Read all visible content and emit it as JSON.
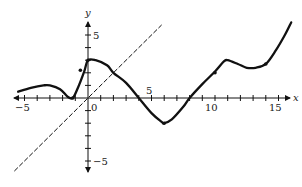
{
  "chart_data": {
    "type": "line",
    "title": "",
    "xlabel": "x",
    "ylabel": "y",
    "xlim": [
      -5.5,
      16
    ],
    "ylim": [
      -6,
      6
    ],
    "grid": false,
    "legend": null,
    "x_ticks": [
      -5,
      -4,
      -3,
      -2,
      -1,
      0,
      1,
      2,
      3,
      4,
      5,
      6,
      7,
      8,
      9,
      10,
      11,
      12,
      13,
      14,
      15
    ],
    "y_ticks": [
      -5,
      -4,
      -3,
      -2,
      -1,
      1,
      2,
      3,
      4,
      5
    ],
    "x_tick_labels": [
      "-5",
      "0",
      "5",
      "10",
      "15"
    ],
    "y_tick_labels": [
      "5",
      "-5"
    ],
    "origin_label": "0",
    "series": [
      {
        "name": "f(x)",
        "style": "solid",
        "color": "#111111",
        "x": [
          -5.5,
          -4.5,
          -3.5,
          -3,
          -2.2,
          -1.6,
          -1.2,
          -0.8,
          -0.3,
          0,
          0.6,
          1.5,
          2,
          3,
          4,
          5,
          5.8,
          6,
          6.6,
          7.5,
          8,
          9,
          10,
          10.7,
          11,
          11.8,
          12.5,
          13.2,
          14,
          14.8,
          15.5,
          16
        ],
        "y": [
          0.5,
          0.8,
          1.0,
          1.0,
          0.7,
          0.1,
          0,
          0.8,
          2.1,
          3.0,
          3.0,
          2.6,
          2.0,
          1.2,
          0,
          -1.2,
          -1.9,
          -2.0,
          -1.7,
          -0.7,
          0,
          1.1,
          2.1,
          2.9,
          3.0,
          2.7,
          2.4,
          2.4,
          2.7,
          3.8,
          5.0,
          6.0
        ],
        "marked_points": [
          [
            -1.2,
            0
          ],
          [
            -0.6,
            2.2
          ],
          [
            0,
            3
          ],
          [
            6,
            -2
          ],
          [
            10,
            2
          ],
          [
            14,
            2.7
          ]
        ]
      },
      {
        "name": "y = x",
        "style": "dashed",
        "color": "#111111",
        "x": [
          -5.8,
          5.8
        ],
        "y": [
          -5.8,
          5.8
        ]
      }
    ]
  },
  "labels": {
    "x_axis": "x",
    "y_axis": "y",
    "x_minus5": "−5",
    "x_0": "0",
    "x_5": "5",
    "x_10": "10",
    "x_15": "15",
    "y_5": "5",
    "y_minus5": "−5"
  }
}
